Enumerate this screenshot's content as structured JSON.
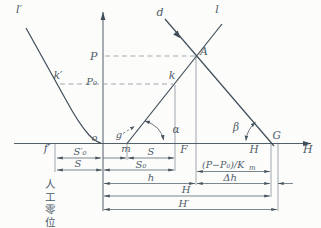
{
  "fig": {
    "lines": {
      "l_prime": "l′",
      "d": "d",
      "l": "l"
    },
    "axis": {
      "h_label": "H",
      "p": "P",
      "p0": "P₀"
    },
    "points": {
      "k_prime": "k′",
      "k": "k",
      "A": "A",
      "g": "g",
      "m": "m",
      "o": "o",
      "f_prime": "f′",
      "F": "F",
      "H_point": "H",
      "G": "G"
    },
    "angles": {
      "alpha": "α",
      "beta": "β"
    },
    "dims": {
      "s0_prime": "S′₀",
      "s_top": "S",
      "s_left": "S",
      "s0": "S₀",
      "h": "h",
      "delta_h": "Δh",
      "formula_main": "(P−P₀)/K",
      "formula_sub": "m",
      "H": "H",
      "H_prime": "H′"
    },
    "annotations": {
      "artificial_zero": "人工零位"
    }
  }
}
